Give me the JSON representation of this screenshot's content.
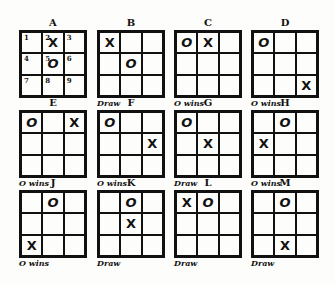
{
  "diagram": {
    "type": "tic-tac-toe opening positions",
    "boards": [
      {
        "label": "A",
        "cells": [
          "1",
          "2 X",
          "3",
          "4",
          "5 O",
          "6",
          "7",
          "8",
          "9"
        ],
        "marks": [
          "",
          "X",
          "",
          "",
          "O",
          "",
          "",
          "",
          ""
        ],
        "numbers": [
          "1",
          "2",
          "3",
          "4",
          "5",
          "6",
          "7",
          "8",
          "9"
        ],
        "result": "",
        "x": 19,
        "y": 30
      },
      {
        "label": "B",
        "marks": [
          "X",
          "",
          "",
          "",
          "O",
          "",
          "",
          "",
          ""
        ],
        "result": "Draw",
        "x": 97,
        "y": 30
      },
      {
        "label": "C",
        "marks": [
          "O",
          "X",
          "",
          "",
          "",
          "",
          "",
          "",
          ""
        ],
        "result": "O wins",
        "x": 174,
        "y": 30
      },
      {
        "label": "D",
        "marks": [
          "O",
          "",
          "",
          "",
          "",
          "",
          "",
          "",
          "X"
        ],
        "result": "O wins",
        "x": 251,
        "y": 30
      },
      {
        "label": "E",
        "marks": [
          "O",
          "",
          "X",
          "",
          "",
          "",
          "",
          "",
          ""
        ],
        "result": "O wins",
        "x": 19,
        "y": 110
      },
      {
        "label": "F",
        "marks": [
          "O",
          "",
          "",
          "",
          "",
          "X",
          "",
          "",
          ""
        ],
        "result": "O wins",
        "x": 97,
        "y": 110
      },
      {
        "label": "G",
        "marks": [
          "O",
          "",
          "",
          "",
          "X",
          "",
          "",
          "",
          ""
        ],
        "result": "Draw",
        "x": 174,
        "y": 110
      },
      {
        "label": "H",
        "marks": [
          "",
          "O",
          "",
          "X",
          "",
          "",
          "",
          "",
          ""
        ],
        "result": "O wins",
        "x": 251,
        "y": 110
      },
      {
        "label": "J",
        "marks": [
          "",
          "O",
          "",
          "",
          "",
          "",
          "X",
          "",
          ""
        ],
        "result": "O wins",
        "x": 19,
        "y": 190
      },
      {
        "label": "K",
        "marks": [
          "",
          "O",
          "",
          "",
          "X",
          "",
          "",
          "",
          ""
        ],
        "result": "Draw",
        "x": 97,
        "y": 190
      },
      {
        "label": "L",
        "marks": [
          "X",
          "O",
          "",
          "",
          "",
          "",
          "",
          "",
          ""
        ],
        "result": "Draw",
        "x": 174,
        "y": 190
      },
      {
        "label": "M",
        "marks": [
          "",
          "O",
          "",
          "",
          "",
          "",
          "",
          "X",
          ""
        ],
        "result": "Draw",
        "x": 251,
        "y": 190
      }
    ]
  }
}
